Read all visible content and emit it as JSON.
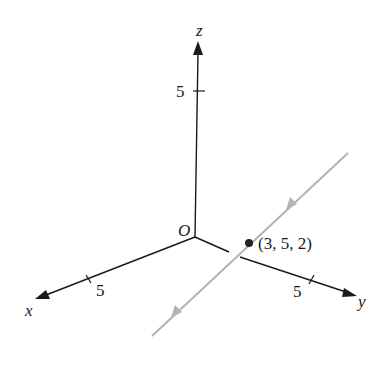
{
  "diagram": {
    "type": "3d-coordinate-axes-with-line",
    "axes": {
      "x": {
        "label": "x",
        "tick_label": "5"
      },
      "y": {
        "label": "y",
        "tick_label": "5"
      },
      "z": {
        "label": "z",
        "tick_label": "5"
      },
      "origin_label": "O"
    },
    "point": {
      "label": "(3, 5, 2)"
    },
    "line": {
      "color": "#b3b3b3",
      "direction": "down-left",
      "arrow_count": 2
    },
    "colors": {
      "axes": "#1a1a1a",
      "line": "#b3b3b3",
      "point": "#222222"
    }
  }
}
